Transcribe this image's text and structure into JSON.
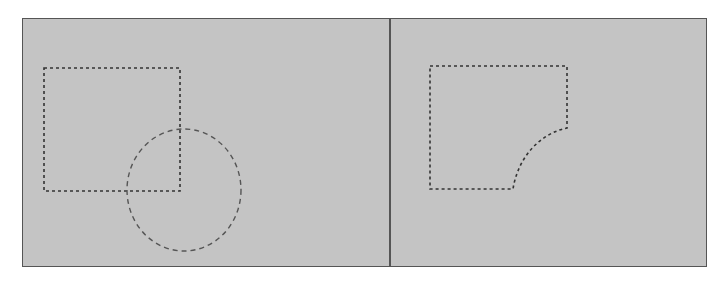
{
  "diagram": {
    "colors": {
      "background": "#c4c4c4",
      "border": "#555555",
      "marquee": "#333333",
      "ellipse": "#555555"
    },
    "panels": [
      {
        "id": "before",
        "shapes": [
          "rectangle-selection",
          "ellipse-selection"
        ]
      },
      {
        "id": "after",
        "shapes": [
          "subtracted-selection"
        ]
      }
    ]
  }
}
